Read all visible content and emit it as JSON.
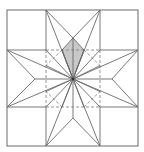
{
  "diagram": {
    "colors": {
      "line": "#6a6a6a",
      "dashed": "#7a7a7a",
      "shade": "#c8c8c8",
      "background": "#ffffff"
    },
    "outer_square": {
      "x1": 7,
      "y1": 10,
      "x2": 138,
      "y2": 146
    },
    "center": {
      "x": 73,
      "y": 79
    },
    "grid": {
      "x": [
        46,
        100
      ],
      "y": [
        50,
        107
      ]
    },
    "star_points": {
      "top": {
        "x": 73,
        "y": 38
      },
      "bottom": {
        "x": 73,
        "y": 118
      },
      "left": {
        "x": 35,
        "y": 79
      },
      "right": {
        "x": 112,
        "y": 79
      }
    },
    "shaded_kite": {
      "points": [
        [
          73,
          38
        ],
        [
          62,
          50
        ],
        [
          73,
          79
        ],
        [
          84,
          50
        ]
      ]
    }
  }
}
